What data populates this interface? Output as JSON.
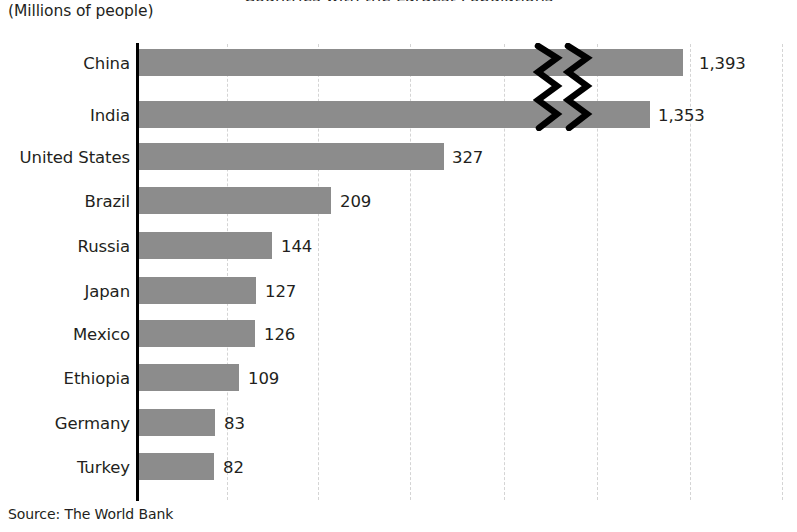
{
  "clipped_title": "Countries with the Largest Populations",
  "subtitle": "(Millions of people)",
  "source": "Source: The World Bank",
  "colors": {
    "bar": "#8c8c8c",
    "axis": "#000000",
    "gridline": "#d4d4d4",
    "text": "#231f20"
  },
  "chart_data": {
    "type": "bar",
    "orientation": "horizontal",
    "title": "Countries with the Largest Populations",
    "subtitle": "(Millions of people)",
    "xlabel": "",
    "ylabel": "",
    "source": "Source: The World Bank",
    "grid": true,
    "grid_axis": "x",
    "legend": false,
    "axis_break": true,
    "axis_break_note": "Zigzag break drawn across the China and India bars",
    "categories": [
      "China",
      "India",
      "United States",
      "Brazil",
      "Russia",
      "Japan",
      "Mexico",
      "Ethiopia",
      "Germany",
      "Turkey"
    ],
    "values": [
      1393,
      1353,
      327,
      209,
      144,
      127,
      126,
      109,
      83,
      82
    ],
    "value_labels": [
      "1,393",
      "1,353",
      "327",
      "209",
      "144",
      "127",
      "126",
      "109",
      "83",
      "82"
    ],
    "units": "millions of people",
    "bars": [
      {
        "category": "China",
        "value": 1393,
        "label": "1,393",
        "bar_px": 544,
        "label_x": 699,
        "row_top": 49
      },
      {
        "category": "India",
        "value": 1353,
        "label": "1,353",
        "bar_px": 511,
        "label_x": 658,
        "row_top": 101
      },
      {
        "category": "United States",
        "value": 327,
        "label": "327",
        "bar_px": 305,
        "label_x": 452,
        "row_top": 143
      },
      {
        "category": "Brazil",
        "value": 209,
        "label": "209",
        "bar_px": 192,
        "label_x": 340,
        "row_top": 187
      },
      {
        "category": "Russia",
        "value": 144,
        "label": "144",
        "bar_px": 133,
        "label_x": 281,
        "row_top": 232
      },
      {
        "category": "Japan",
        "value": 127,
        "label": "127",
        "bar_px": 117,
        "label_x": 265,
        "row_top": 277
      },
      {
        "category": "Mexico",
        "value": 126,
        "label": "126",
        "bar_px": 116,
        "label_x": 264,
        "row_top": 320
      },
      {
        "category": "Ethiopia",
        "value": 109,
        "label": "109",
        "bar_px": 100,
        "label_x": 248,
        "row_top": 364
      },
      {
        "category": "Germany",
        "value": 83,
        "label": "83",
        "bar_px": 76,
        "label_x": 224,
        "row_top": 409
      },
      {
        "category": "Turkey",
        "value": 82,
        "label": "82",
        "bar_px": 75,
        "label_x": 223,
        "row_top": 453
      }
    ],
    "gridlines_px": [
      227,
      318,
      410,
      504,
      597,
      690,
      782
    ]
  }
}
